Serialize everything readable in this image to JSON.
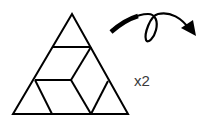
{
  "figure": {
    "multiplier_label": "x2",
    "stroke_color": "#000000",
    "label_color": "#3a3a3a",
    "shapes": {
      "outer_triangle": "equilateral triangle divided into pieces",
      "pieces": [
        "top-small-triangle",
        "upper-parallelogram",
        "bottom-left-triangle",
        "bottom-middle-parallelogram",
        "bottom-right-triangle",
        "right-parallelogram"
      ]
    },
    "arrow": "looping-curved-arrow"
  }
}
